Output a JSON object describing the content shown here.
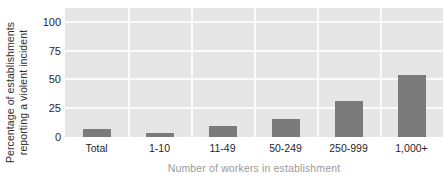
{
  "chart_data": {
    "type": "bar",
    "title": "",
    "subtitle": "",
    "xlabel": "Number of workers in establishment",
    "ylabel_line1": "Percentage of establishments",
    "ylabel_line2": "reporting a violent incident",
    "ylabel": "Percentage of establishments reporting a violent incident",
    "categories": [
      "Total",
      "1-10",
      "11-49",
      "50-249",
      "250-999",
      "1,000+"
    ],
    "values": [
      7,
      3.5,
      9.5,
      15.5,
      31,
      54
    ],
    "series": [
      {
        "name": "Percentage of establishments reporting a violent incident",
        "values": [
          7,
          3.5,
          9.5,
          15.5,
          31,
          54
        ]
      }
    ],
    "ylim": [
      0,
      112
    ],
    "yticks": [
      0,
      25,
      50,
      75,
      100
    ],
    "ytick_labels": [
      "0",
      "25",
      "50",
      "75",
      "100"
    ],
    "grid": "horizontal-and-vertical",
    "legend": "none",
    "annotations": [],
    "colors": {
      "bar": "#7b7b7b",
      "plot_background": "#e6e6e6",
      "gridline": "#fbfbfb",
      "tick_label": "#1f1f1f",
      "axis_title_x": "#9a9a9a",
      "axis_title_y": "#2e2e2e",
      "figure_background": "#ffffff"
    }
  }
}
